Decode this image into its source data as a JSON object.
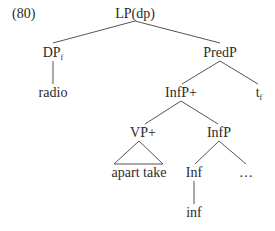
{
  "example_number": "(80)",
  "tree": {
    "root": "LP(dp)",
    "dp": {
      "label": "DP",
      "sub": "f"
    },
    "radio": "radio",
    "predp": "PredP",
    "infp_plus": "InfP+",
    "trace": {
      "label": "t",
      "sub": "f"
    },
    "vp_plus": "VP+",
    "infp": "InfP",
    "apart_take": "apart take",
    "inf_head": "Inf",
    "ellipsis": "…",
    "inf_leaf": "inf"
  }
}
